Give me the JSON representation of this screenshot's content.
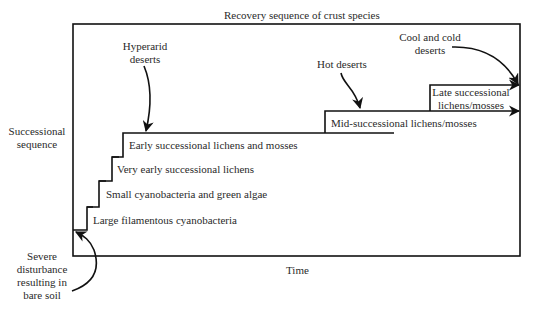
{
  "title": "Recovery sequence of crust species",
  "axes": {
    "y_label_line1": "Successional",
    "y_label_line2": "sequence",
    "x_label": "Time"
  },
  "stages": [
    {
      "label": "Large filamentous cyanobacteria"
    },
    {
      "label": "Small cyanobacteria and green algae"
    },
    {
      "label": "Very early successional lichens"
    },
    {
      "label": "Early successional lichens and mosses"
    },
    {
      "label": "Mid-successional lichens/mosses"
    },
    {
      "label_line1": "Late successional",
      "label_line2": "lichens/mosses"
    }
  ],
  "annotations": {
    "hyperarid_line1": "Hyperarid",
    "hyperarid_line2": "deserts",
    "hot": "Hot deserts",
    "cool_line1": "Cool and cold",
    "cool_line2": "deserts",
    "disturbance_line1": "Severe",
    "disturbance_line2": "disturbance",
    "disturbance_line3": "resulting in",
    "disturbance_line4": "bare soil"
  },
  "colors": {
    "line": "#111111",
    "text": "#2a2a2a",
    "background": "#ffffff"
  }
}
